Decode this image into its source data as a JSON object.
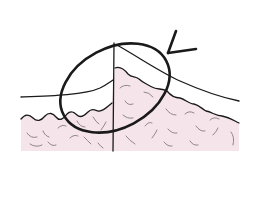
{
  "figure": {
    "colors": {
      "background": "#ffffff",
      "tissue_fill": "#f5e4ea",
      "outline": "#1a1a1a",
      "lobule_stroke": "#6e6a70"
    },
    "elements": {
      "skin_surface_line": "skin-surface",
      "tissue_boundary": "wavy-tissue-edge",
      "vertical_line": "incision-line",
      "highlight": "ellipse",
      "pointer": "arrow"
    },
    "text_labels": []
  }
}
